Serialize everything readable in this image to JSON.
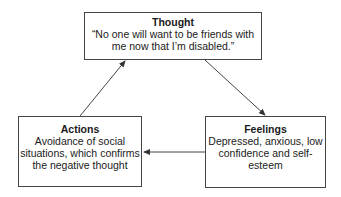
{
  "diagram": {
    "thought": {
      "title": "Thought",
      "body": "“No one will want to be friends with me now that I’m disabled.”"
    },
    "feelings": {
      "title": "Feelings",
      "body": "Depressed, anxious, low confidence and self-esteem"
    },
    "actions": {
      "title": "Actions",
      "body": "Avoidance of social situations, which confirms the negative thought"
    },
    "edges": [
      {
        "from": "thought",
        "to": "feelings"
      },
      {
        "from": "feelings",
        "to": "actions"
      },
      {
        "from": "actions",
        "to": "thought"
      }
    ],
    "colors": {
      "stroke": "#444444",
      "text": "#1a1a1a",
      "background": "#ffffff"
    }
  }
}
